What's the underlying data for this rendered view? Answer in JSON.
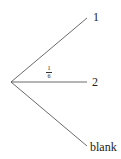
{
  "diagram": {
    "type": "tree",
    "origin": {
      "x": 11,
      "y": 82
    },
    "branches": [
      {
        "label": "1",
        "end": {
          "x": 87,
          "y": 18
        },
        "probability": ""
      },
      {
        "label": "2",
        "end": {
          "x": 87,
          "y": 82
        },
        "probability": "1/6"
      },
      {
        "label": "blank",
        "end": {
          "x": 87,
          "y": 146
        },
        "probability": ""
      }
    ],
    "fraction": {
      "numerator": "1",
      "denominator": "6"
    },
    "line_color": "#444444"
  }
}
